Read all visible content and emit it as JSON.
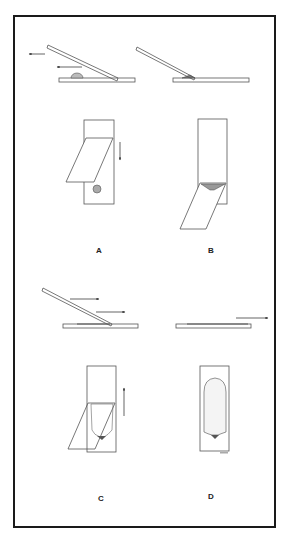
{
  "figure": {
    "panels": [
      {
        "id": "A",
        "label": "A",
        "step": "Drop placed; spreader slide drawn back into drop",
        "arrows": 3
      },
      {
        "id": "B",
        "label": "B",
        "step": "Blood spreads along edge of spreader slide",
        "arrows": 0
      },
      {
        "id": "C",
        "label": "C",
        "step": "Spreader pushed forward to draw out smear",
        "arrows": 3
      },
      {
        "id": "D",
        "label": "D",
        "step": "Finished smear with feathered edge",
        "arrows": 1
      }
    ],
    "colors": {
      "line": "#555555",
      "frame": "#1a1a1a",
      "smear": "#8a8a8a",
      "background": "#ffffff"
    },
    "tiny_caption": ""
  }
}
